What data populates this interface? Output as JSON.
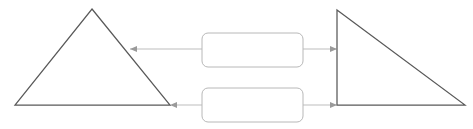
{
  "diagram": {
    "title": "",
    "background_color": "#ffffff",
    "canvas": {
      "width": 473,
      "height": 129
    },
    "shape_stroke_color": "#595959",
    "box_stroke_color": "#b8b8b8",
    "connector_color": "#bdbdbd",
    "arrowhead_color": "#9a9a9a",
    "shapes": [
      {
        "id": "left-triangle",
        "type": "triangle",
        "orientation": "isosceles-apex-up",
        "label": "",
        "points": "92,9 170,105 15,105"
      },
      {
        "id": "right-triangle",
        "type": "triangle",
        "orientation": "right-triangle-vertical-left-edge",
        "label": "",
        "points": "337,10 465,105 337,105"
      }
    ],
    "boxes": [
      {
        "id": "top-box",
        "type": "rounded-rectangle",
        "label": "",
        "x": 202,
        "y": 33,
        "width": 101,
        "height": 34,
        "corner_radius": 6
      },
      {
        "id": "bottom-box",
        "type": "rounded-rectangle",
        "label": "",
        "x": 202,
        "y": 88,
        "width": 101,
        "height": 34,
        "corner_radius": 6
      }
    ],
    "connectors": [
      {
        "id": "top-box-to-left-triangle",
        "from": "top-box",
        "to": "left-triangle",
        "direction": "left",
        "label": "",
        "path": "M202,49 L130,49",
        "arrow_at": {
          "x": 130,
          "y": 49,
          "points": "130,49 137,46 137,52"
        }
      },
      {
        "id": "top-box-to-right-triangle",
        "from": "top-box",
        "to": "right-triangle",
        "direction": "right",
        "label": "",
        "path": "M303,49 L336,49",
        "arrow_at": {
          "x": 337,
          "y": 49,
          "points": "337,49 330,46 330,52"
        }
      },
      {
        "id": "bottom-box-to-left-triangle",
        "from": "bottom-box",
        "to": "left-triangle",
        "direction": "left",
        "label": "",
        "path": "M202,105 L172,105",
        "arrow_at": {
          "x": 170,
          "y": 105,
          "points": "170,105 177,102 177,108"
        }
      },
      {
        "id": "bottom-box-to-right-triangle",
        "from": "bottom-box",
        "to": "right-triangle",
        "direction": "right",
        "label": "",
        "path": "M303,105 L336,105",
        "arrow_at": {
          "x": 337,
          "y": 105,
          "points": "337,105 330,102 330,108"
        }
      }
    ]
  }
}
